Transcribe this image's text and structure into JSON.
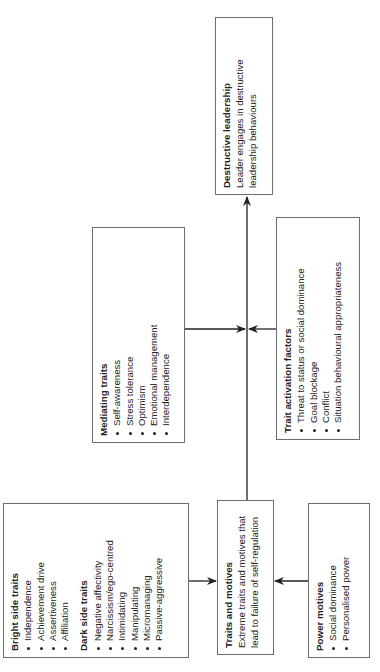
{
  "diagram": {
    "orientation": "rotated-90-ccw",
    "nodes": {
      "bright_dark": {
        "bright_title": "Bright side traits",
        "bright_items": [
          "Independence",
          "Achievement drive",
          "Assertiveness",
          "Affiliation"
        ],
        "dark_title": "Dark side traits",
        "dark_items": [
          "Negative affectivity",
          "Narcissism/ego-centred",
          "Intimidating",
          "Manipulating",
          "Micromanaging",
          "Passive-aggressive"
        ]
      },
      "traits_motives": {
        "title": "Traits and motives",
        "desc_line1": "Extreme traits and motives that",
        "desc_line2": "lead to failure of self-regulation"
      },
      "power_motives": {
        "title": "Power motives",
        "items": [
          "Social dominance",
          "Personalised power"
        ]
      },
      "mediating": {
        "title": "Mediating traits",
        "items": [
          "Self-awareness",
          "Stress tolerance",
          "Optimism",
          "Emotional management",
          "Interdependence"
        ]
      },
      "activation": {
        "title": "Trait activation factors",
        "items": [
          "Threat to status or social dominance",
          "Goal blockage",
          "Conflict",
          "Situation behavioural appropriateness"
        ]
      },
      "destructive": {
        "title": "Destructive leadership",
        "desc_line1": "Leader engages in destructive",
        "desc_line2": "leadership behaviours"
      }
    },
    "edges": [
      {
        "from": "Bright/Dark side traits",
        "to": "Traits and motives"
      },
      {
        "from": "Power motives",
        "to": "Traits and motives"
      },
      {
        "from": "Traits and motives",
        "to": "Destructive leadership"
      },
      {
        "from": "Mediating traits",
        "to": "Traits and motives → Destructive leadership link"
      },
      {
        "from": "Trait activation factors",
        "to": "Traits and motives → Destructive leadership link"
      }
    ],
    "colors": {
      "line": "#222222",
      "border": "#6d6d6d",
      "text": "#222222"
    }
  }
}
